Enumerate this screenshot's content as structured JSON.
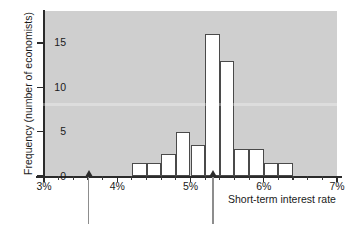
{
  "chart_data": {
    "type": "bar",
    "title": "",
    "subtitle": "",
    "xlabel": "Short-term interest rate",
    "ylabel": "Frequency (number of economists)",
    "xlim": [
      3,
      7
    ],
    "ylim": [
      0,
      18.6
    ],
    "bin_width": 0.2,
    "grid": false,
    "legend": null,
    "x_tick_labels": [
      "3%",
      "4%",
      "5%",
      "6%",
      "7%"
    ],
    "x_tick_values": [
      3,
      4,
      5,
      6,
      7
    ],
    "x_minor_tick_values": [
      3.2,
      3.4,
      3.6,
      3.8,
      4.2,
      4.4,
      4.6,
      4.8,
      5.2,
      5.4,
      5.6,
      5.8,
      6.2,
      6.4,
      6.6,
      6.8
    ],
    "y_tick_labels": [
      "0",
      "5",
      "10",
      "15"
    ],
    "y_tick_values": [
      0,
      5,
      10,
      15
    ],
    "categories": [
      "4.2%-4.4%",
      "4.4%-4.6%",
      "4.6%-4.8%",
      "4.8%-5.0%",
      "5.0%-5.2%",
      "5.2%-5.4%",
      "5.4%-5.6%",
      "5.6%-5.8%",
      "5.8%-6.0%",
      "6.0%-6.2%",
      "6.2%-6.4%"
    ],
    "bin_starts": [
      4.2,
      4.4,
      4.6,
      4.8,
      5.0,
      5.2,
      5.4,
      5.6,
      5.8,
      6.0,
      6.2
    ],
    "values": [
      1.5,
      1.5,
      2.5,
      5,
      3.5,
      16,
      13,
      3,
      3,
      1.5,
      1.5
    ],
    "bar_face_color": "#ffffff",
    "bar_edge_color": "#4a4a4a",
    "plot_background_color": "#cfcfcf",
    "axis_color": "#2b2b2b",
    "annotations": [
      {
        "name": "arrow-marker-low",
        "x": 3.6,
        "label": ""
      },
      {
        "name": "arrow-marker-high",
        "x": 5.3,
        "label": ""
      }
    ]
  }
}
